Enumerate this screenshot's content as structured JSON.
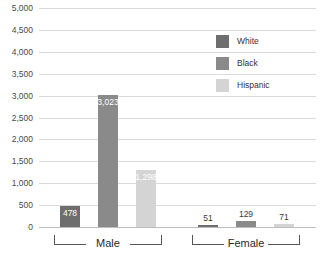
{
  "chart_data": {
    "type": "bar",
    "title": "",
    "xlabel": "",
    "ylabel": "",
    "ylim": [
      0,
      5000
    ],
    "ytick_labels": [
      "5,000",
      "4,500",
      "4,000",
      "3,500",
      "3,000",
      "2,500",
      "2,000",
      "1,500",
      "1,000",
      "500",
      "0"
    ],
    "ytick_values": [
      5000,
      4500,
      4000,
      3500,
      3000,
      2500,
      2000,
      1500,
      1000,
      500,
      0
    ],
    "grid": "horizontal",
    "legend_position": "right",
    "categories": [
      "Male",
      "Female"
    ],
    "series": [
      {
        "name": "White",
        "color": "#6e6e6e",
        "values": [
          478,
          51
        ],
        "labels": [
          "478",
          "51"
        ]
      },
      {
        "name": "Black",
        "color": "#8a8a8a",
        "values": [
          3023,
          129
        ],
        "labels": [
          "3,023",
          "129"
        ]
      },
      {
        "name": "Hispanic",
        "color": "#d4d4d4",
        "values": [
          1298,
          71
        ],
        "labels": [
          "1,298",
          "71"
        ]
      }
    ]
  },
  "legend": {
    "items": [
      {
        "label": "White",
        "color": "#6e6e6e"
      },
      {
        "label": "Black",
        "color": "#8a8a8a"
      },
      {
        "label": "Hispanic",
        "color": "#d4d4d4"
      }
    ]
  },
  "groups": [
    {
      "label": "Male"
    },
    {
      "label": "Female"
    }
  ],
  "axis": {
    "ticks": [
      "5,000",
      "4,500",
      "4,000",
      "3,500",
      "3,000",
      "2,500",
      "2,000",
      "1,500",
      "1,000",
      "500",
      "0"
    ]
  },
  "bars": [
    {
      "group": "Male",
      "series": "White",
      "value": 478,
      "label": "478",
      "color": "#6e6e6e"
    },
    {
      "group": "Male",
      "series": "Black",
      "value": 3023,
      "label": "3,023",
      "color": "#8a8a8a"
    },
    {
      "group": "Male",
      "series": "Hispanic",
      "value": 1298,
      "label": "1,298",
      "color": "#d4d4d4"
    },
    {
      "group": "Female",
      "series": "White",
      "value": 51,
      "label": "51",
      "color": "#6e6e6e"
    },
    {
      "group": "Female",
      "series": "Black",
      "value": 129,
      "label": "129",
      "color": "#8a8a8a"
    },
    {
      "group": "Female",
      "series": "Hispanic",
      "value": 71,
      "label": "71",
      "color": "#d4d4d4"
    }
  ]
}
